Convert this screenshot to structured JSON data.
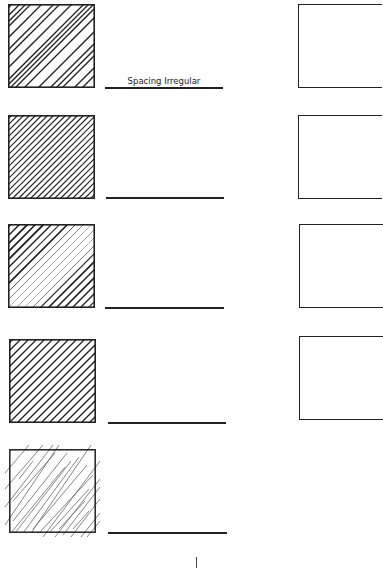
{
  "worksheet": {
    "rows": [
      {
        "pattern": "irregular-spacing",
        "line_label": "Spacing Irregular",
        "box_top": 4,
        "line_top": 87
      },
      {
        "pattern": "dense-uniform",
        "line_label": "",
        "box_top": 115,
        "line_top": 197
      },
      {
        "pattern": "varying-weight",
        "line_label": "",
        "box_top": 224,
        "line_top": 307
      },
      {
        "pattern": "uniform-medium",
        "line_label": "",
        "box_top": 339,
        "line_top": 422
      },
      {
        "pattern": "light-overrun",
        "line_label": "",
        "box_top": 449,
        "line_top": 532
      }
    ],
    "practice_boxes": [
      {
        "top": 4
      },
      {
        "top": 115
      },
      {
        "top": 224
      },
      {
        "top": 336
      }
    ],
    "colors": {
      "ink": "#222222",
      "light_ink": "#555555",
      "background": "#ffffff"
    }
  }
}
